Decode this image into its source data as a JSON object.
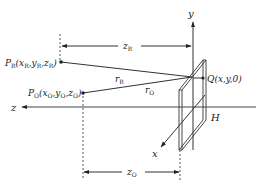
{
  "diagram": {
    "type": "holography-geometry",
    "axes": {
      "y_label": "y",
      "z_label": "z",
      "x_label": "x"
    },
    "points": {
      "reference": {
        "name": "P",
        "sub": "R",
        "coords": "(x",
        "full": "P_R(x_R,y_R,z_R)"
      },
      "object": {
        "name": "P",
        "sub": "O",
        "full": "P_O(x_O,y_O,z_O)"
      },
      "hologram_point": {
        "full": "Q(x,y,0)"
      }
    },
    "distances": {
      "r_R": "r_R",
      "r_O": "r_O",
      "z_R": "z_R",
      "z_O": "z_O"
    },
    "plate_label": "H",
    "colors": {
      "line": "#222222",
      "background": "#ffffff"
    }
  },
  "labels": {
    "y": "y",
    "z": "z",
    "x": "x",
    "H": "H",
    "PR_P": "P",
    "PR_sub": "R",
    "PR_coords_open": "(x",
    "PR_xsub": "R",
    "PR_y": ",y",
    "PR_ysub": "R",
    "PR_z": ",z",
    "PR_zsub": "R",
    "PR_close": ")",
    "PO_P": "P",
    "PO_sub": "O",
    "PO_coords_open": "(x",
    "PO_xsub": "O",
    "PO_y": ",y",
    "PO_ysub": "O",
    "PO_z": ",z",
    "PO_zsub": "O",
    "PO_close": ")",
    "Q": "Q(x,y,0)",
    "rR_r": "r",
    "rR_sub": "R",
    "rO_r": "r",
    "rO_sub": "O",
    "zR_z": "z",
    "zR_sub": "R",
    "zO_z": "z",
    "zO_sub": "O"
  }
}
